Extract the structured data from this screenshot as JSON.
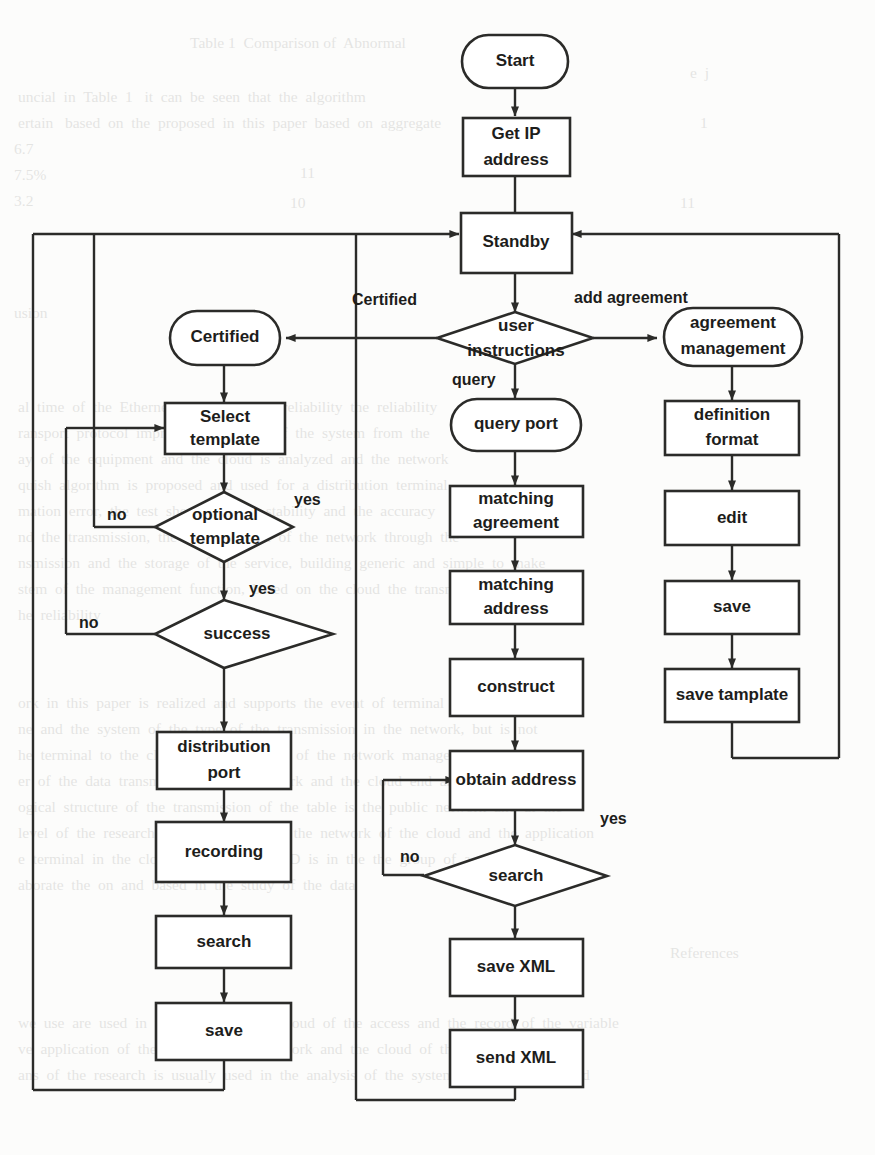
{
  "diagram": {
    "colors": {
      "stroke": "#2b2b29",
      "fill": "#ffffff",
      "text": "#1d1d1b",
      "page": "#fcfcfb"
    },
    "nodes": {
      "start": {
        "label": "Start",
        "shape": "terminator"
      },
      "get_ip": {
        "label": "Get IP\naddress",
        "line1": "Get IP",
        "line2": "address",
        "shape": "process"
      },
      "standby": {
        "label": "Standby",
        "shape": "process"
      },
      "user_instructions": {
        "label": "user\ninstructions",
        "line1": "user",
        "line2": "instructions",
        "shape": "decision"
      },
      "certified": {
        "label": "Certified",
        "shape": "terminator"
      },
      "agreement_management": {
        "label": "agreement\nmanagement",
        "line1": "agreement",
        "line2": "management",
        "shape": "terminator"
      },
      "select_template": {
        "label": "Select\ntemplate",
        "line1": "Select",
        "line2": "template",
        "shape": "process"
      },
      "optional_template": {
        "label": "optional\ntemplate",
        "line1": "optional",
        "line2": "template",
        "shape": "decision"
      },
      "success": {
        "label": "success",
        "shape": "decision"
      },
      "distribution_port": {
        "label": "distribution\nport",
        "line1": "distribution",
        "line2": "port",
        "shape": "process"
      },
      "recording": {
        "label": "recording",
        "shape": "process"
      },
      "search_left": {
        "label": "search",
        "shape": "process"
      },
      "save_left": {
        "label": "save",
        "shape": "process"
      },
      "query_port": {
        "label": "query port",
        "shape": "terminator"
      },
      "matching_agreement": {
        "label": "matching\nagreement",
        "line1": "matching",
        "line2": "agreement",
        "shape": "process"
      },
      "matching_address": {
        "label": "matching\naddress",
        "line1": "matching",
        "line2": "address",
        "shape": "process"
      },
      "construct": {
        "label": "construct",
        "shape": "process"
      },
      "obtain_address": {
        "label": "obtain address",
        "shape": "process"
      },
      "search_decision": {
        "label": "search",
        "shape": "decision"
      },
      "save_xml": {
        "label": "save XML",
        "shape": "process"
      },
      "send_xml": {
        "label": "send XML",
        "shape": "process"
      },
      "definition_format": {
        "label": "definition\nformat",
        "line1": "definition",
        "line2": "format",
        "shape": "process"
      },
      "edit": {
        "label": "edit",
        "shape": "process"
      },
      "save_right": {
        "label": "save",
        "shape": "process"
      },
      "save_template": {
        "label": "save tamplate",
        "shape": "process"
      }
    },
    "edge_labels": {
      "certified": "Certified",
      "add_agreement": "add agreement",
      "query": "query",
      "optional_yes": "yes",
      "optional_no": "no",
      "success_yes": "yes",
      "success_no": "no",
      "search_yes": "yes",
      "search_no": "no"
    },
    "background_text": [
      {
        "x": 190,
        "y": 30,
        "t": "Table 1  Comparison of  Abnormal"
      },
      {
        "x": 18,
        "y": 84,
        "t": "uncial  in  Table  1   it  can  be  seen  that  the  algorithm"
      },
      {
        "x": 18,
        "y": 110,
        "t": "ertain   based  on  the  proposed  in  this  paper  based  on  aggregate"
      },
      {
        "x": 690,
        "y": 60,
        "t": "e  j"
      },
      {
        "x": 700,
        "y": 110,
        "t": "1"
      },
      {
        "x": 14,
        "y": 136,
        "t": "6.7"
      },
      {
        "x": 14,
        "y": 162,
        "t": "7.5%"
      },
      {
        "x": 14,
        "y": 188,
        "t": "3.2"
      },
      {
        "x": 290,
        "y": 190,
        "t": "10"
      },
      {
        "x": 300,
        "y": 160,
        "t": "11"
      },
      {
        "x": 680,
        "y": 190,
        "t": "11"
      },
      {
        "x": 14,
        "y": 300,
        "t": "usion"
      },
      {
        "x": 18,
        "y": 394,
        "t": "al  time  of  the  Ethernet  and  the  grid  I  reliability  the  reliability"
      },
      {
        "x": 18,
        "y": 420,
        "t": "ransport  protocol  improved  the  safety  of  the  system  from  the"
      },
      {
        "x": 18,
        "y": 446,
        "t": "ay  of  the  equipment  and  the  cloud  is  analyzed  and  the  network"
      },
      {
        "x": 18,
        "y": 472,
        "t": "quish  algorithm  is  proposed  and  used  for  a  distribution  terminal"
      },
      {
        "x": 18,
        "y": 498,
        "t": "mation  error,  the  test  shows  that  its  stability  and  the  accuracy"
      },
      {
        "x": 18,
        "y": 524,
        "t": "nd  the  transmission,  the  type  function  of  the  network  through  the"
      },
      {
        "x": 18,
        "y": 550,
        "t": "nsmission  and  the  storage  of  the  service,  building  generic  and  simple  to  make"
      },
      {
        "x": 18,
        "y": 576,
        "t": "stem  of  the  management  function,  based  on  the  cloud  the  transmission"
      },
      {
        "x": 18,
        "y": 602,
        "t": "he  reliability"
      },
      {
        "x": 18,
        "y": 690,
        "t": "ork  in  this  paper  is  realized  and  supports  the  event  of  terminal  access  and"
      },
      {
        "x": 18,
        "y": 716,
        "t": "ne  and  the  system  of  the  type  of  the  transmission  in  the  network,  but  is  not"
      },
      {
        "x": 18,
        "y": 742,
        "t": "he  terminal  to  the  cloud  end  the  system  of  the  network  management"
      },
      {
        "x": 18,
        "y": 768,
        "t": "er  of  the  data  transmission  of  the  network  and  the  cloud  end  and  could"
      },
      {
        "x": 18,
        "y": 794,
        "t": "ogical  structure  of  the  transmission  of  the  table  is  the  public  network  and  at  the"
      },
      {
        "x": 18,
        "y": 820,
        "t": "level  of  the  research  and  comparison  of  the  network  of  the  cloud  and  the  application"
      },
      {
        "x": 18,
        "y": 846,
        "t": "e  terminal  in  the  cloud  of  the  type  GRID  is  in  the  the  group  of  a  system"
      },
      {
        "x": 18,
        "y": 872,
        "t": "aborate  the  on  and  based  in  the  study  of  the  data"
      },
      {
        "x": 670,
        "y": 940,
        "t": "References"
      },
      {
        "x": 18,
        "y": 1010,
        "t": "we  use  are  used  in  the  paper  and  the  cloud  of  the  access  and  the  record  of  the  variable"
      },
      {
        "x": 18,
        "y": 1036,
        "t": "ve  application  of  the  system  in  the  network  and  the  cloud  of  the  application  to"
      },
      {
        "x": 18,
        "y": 1062,
        "t": "ans  of  the  research  is  usually  used  in  the  analysis  of  the  system  based  on  the  cloud"
      }
    ]
  }
}
